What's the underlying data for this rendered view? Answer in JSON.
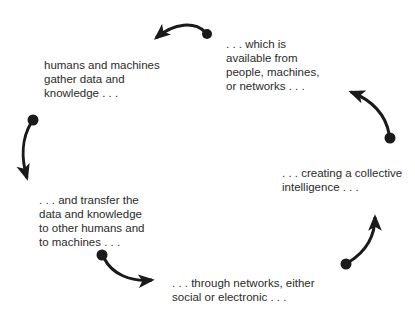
{
  "diagram": {
    "type": "cycle",
    "colors": {
      "text": "#2b2b2b",
      "arrow": "#1a1a1a",
      "background": "#ffffff"
    },
    "steps": [
      {
        "id": "gather",
        "lines": [
          "humans and machines",
          "gather data and",
          "knowledge . . ."
        ]
      },
      {
        "id": "available",
        "lines": [
          ". . . which is",
          "available from",
          "people, machines,",
          "or networks . . ."
        ]
      },
      {
        "id": "collective",
        "lines": [
          ". . . creating a collective",
          "intelligence . . ."
        ]
      },
      {
        "id": "through",
        "lines": [
          ". . . through networks, either",
          "social or electronic . . ."
        ]
      },
      {
        "id": "transfer",
        "lines": [
          ". . . and transfer the",
          "data and knowledge",
          "to other humans and",
          "to machines . . ."
        ]
      }
    ],
    "arrows": [
      {
        "from": "available",
        "to": "gather",
        "icon": "curved-arrow-left"
      },
      {
        "from": "gather",
        "to": "transfer",
        "icon": "curved-arrow-down"
      },
      {
        "from": "transfer",
        "to": "through",
        "icon": "curved-arrow-right"
      },
      {
        "from": "through",
        "to": "collective",
        "icon": "curved-arrow-up"
      },
      {
        "from": "collective",
        "to": "available",
        "icon": "curved-arrow-up-left"
      }
    ]
  }
}
